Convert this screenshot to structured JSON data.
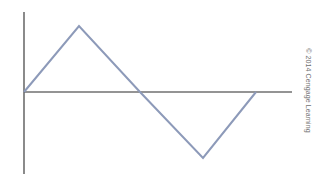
{
  "figure": {
    "background_color": "#ffffff",
    "width": 316,
    "height": 184
  },
  "axes": {
    "color": "#2b2b2b",
    "line_width": 1,
    "origin": {
      "x": 24,
      "y": 92
    },
    "x_axis": {
      "start_x": 24,
      "end_x": 292,
      "y": 92
    },
    "y_axis": {
      "x": 24,
      "start_y": 12,
      "end_y": 174
    }
  },
  "credit": {
    "text": "© 2014 Cengage Learning",
    "color": "#6f6f6f",
    "rotation_degrees": 90
  },
  "chart_data": {
    "type": "line",
    "title": "",
    "subtitle": "",
    "xlabel": "",
    "ylabel": "",
    "grid": false,
    "legend": null,
    "series": [
      {
        "name": "triangular-waveform",
        "color": "#8d9ab9",
        "line_width": 2,
        "x": [
          0,
          1,
          2,
          3,
          4
        ],
        "values": [
          0,
          1,
          0,
          -1,
          0
        ],
        "pixel_points": "24,92 79,26 140,92 203,158 256,92"
      }
    ],
    "x": [
      0,
      1,
      2,
      3,
      4
    ],
    "xlim": [
      0,
      4.9
    ],
    "ylim": [
      -1.25,
      1.25
    ],
    "annotations": [],
    "tick_labels": {
      "x": [],
      "y": []
    }
  }
}
